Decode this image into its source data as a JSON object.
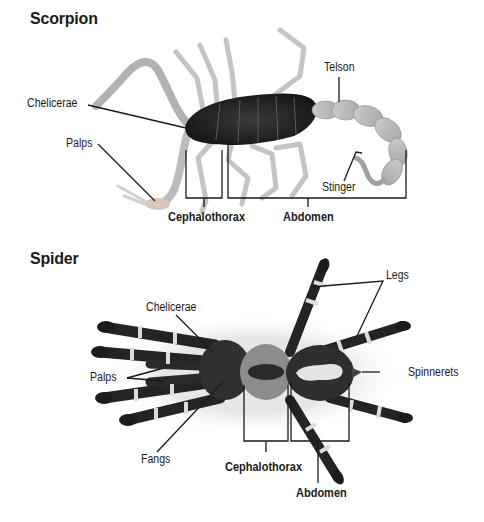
{
  "figure": {
    "panels": [
      {
        "title": "Scorpion",
        "labels": {
          "chelicerae": "Chelicerae",
          "palps": "Palps",
          "telson": "Telson",
          "stinger": "Stinger",
          "cephalothorax": "Cephalothorax",
          "abdomen": "Abdomen"
        }
      },
      {
        "title": "Spider",
        "labels": {
          "chelicerae": "Chelicerae",
          "legs": "Legs",
          "palps": "Palps",
          "spinnerets": "Spinnerets",
          "fangs": "Fangs",
          "cephalothorax": "Cephalothorax",
          "abdomen": "Abdomen"
        }
      }
    ],
    "colors": {
      "leader_line": "#1a1a1a",
      "scorpion_body": "#2a2a2a",
      "scorpion_limb": "#b8b8b8",
      "spider_dark": "#222222",
      "spider_light": "#d8d8d8"
    }
  }
}
